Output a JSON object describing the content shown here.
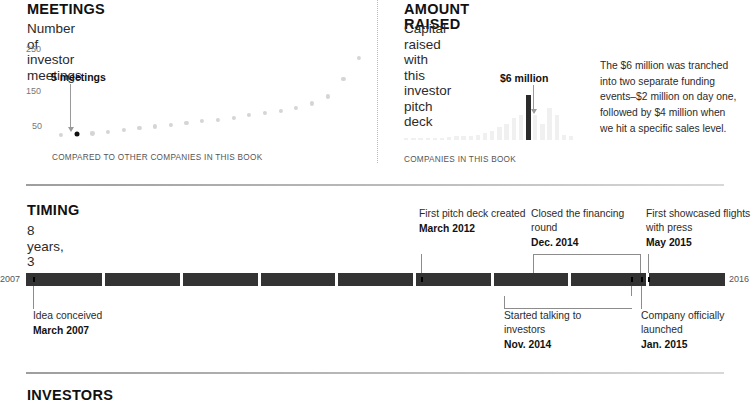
{
  "meetings": {
    "title": "MEETINGS",
    "subtitle": "Number of investor meetings",
    "x_caption": "COMPARED TO OTHER COMPANIES IN THIS BOOK",
    "callout": "5 meetings",
    "y_ticks": [
      "250",
      "150",
      "50"
    ]
  },
  "amount": {
    "title": "AMOUNT RAISED",
    "subtitle": "Capital raised with this investor pitch deck",
    "x_caption": "COMPANIES IN THIS BOOK",
    "callout": "$6 million",
    "note": "The $6 million was tranched into two separate funding events–$2 million on day one, followed by $4 million when we hit a specific sales level."
  },
  "timing": {
    "title": "TIMING",
    "subtitle": "8 years, 3 months",
    "start_year": "2007",
    "end_year": "2016",
    "events_above": [
      {
        "text": "First pitch deck created",
        "date": "March 2012"
      },
      {
        "text": "Closed the financing round",
        "date": "Dec. 2014"
      },
      {
        "text": "First showcased flights with press",
        "date": "May 2015"
      }
    ],
    "events_below": [
      {
        "text": "Idea conceived",
        "date": "March 2007"
      },
      {
        "text": "Started talking to investors",
        "date": "Nov. 2014"
      },
      {
        "text": "Company officially launched",
        "date": "Jan. 2015"
      }
    ]
  },
  "investors": {
    "title": "INVESTORS"
  },
  "chart_data": [
    {
      "type": "scatter",
      "title": "Number of investor meetings",
      "xlabel": "COMPARED TO OTHER COMPANIES IN THIS BOOK",
      "ylabel": "",
      "ylim": [
        0,
        290
      ],
      "yticks": [
        50,
        150,
        250
      ],
      "grid": false,
      "annotation": "5 meetings",
      "highlight_index": 1,
      "values": [
        3,
        5,
        8,
        12,
        20,
        26,
        30,
        34,
        42,
        47,
        50,
        58,
        66,
        73,
        78,
        88,
        103,
        125,
        180,
        245
      ]
    },
    {
      "type": "bar",
      "title": "Capital raised with this investor pitch deck",
      "xlabel": "COMPANIES IN THIS BOOK",
      "annotation": "$6 million",
      "highlight_index": 17,
      "grid": false,
      "values": [
        1,
        1,
        1,
        1,
        1,
        1,
        1.5,
        2,
        2,
        2,
        3,
        4,
        5,
        7,
        9,
        12,
        14,
        25,
        14,
        9,
        18,
        14,
        3,
        2
      ]
    }
  ]
}
